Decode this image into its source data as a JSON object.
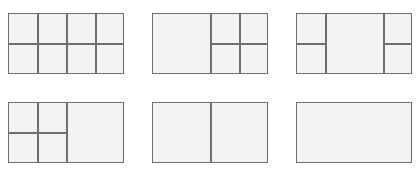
{
  "colors": {
    "background": "#ffffff",
    "pane_fill": "#f3f3f3",
    "border": "#6f6f6f"
  },
  "layouts": [
    {
      "id": "grid-4x2",
      "description": "8 panes: 4 columns by 2 rows"
    },
    {
      "id": "large-left-4-right",
      "description": "1 large pane left, 2x2 grid right"
    },
    {
      "id": "large-center-2-sides",
      "description": "1 large pane center, 2 stacked panes on each side"
    },
    {
      "id": "4-left-large-right",
      "description": "2x2 grid left, 1 large pane right"
    },
    {
      "id": "two-columns",
      "description": "2 equal panes side by side"
    },
    {
      "id": "single",
      "description": "1 single pane"
    }
  ]
}
